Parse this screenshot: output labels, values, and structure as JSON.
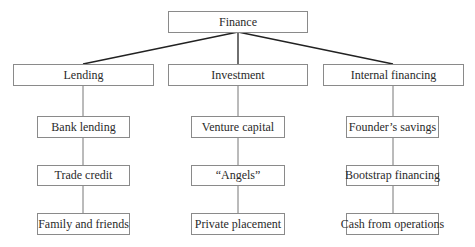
{
  "diagram": {
    "root": {
      "label": "Finance"
    },
    "categories": [
      {
        "label": "Lending",
        "children": [
          "Bank lending",
          "Trade credit",
          "Family and friends"
        ]
      },
      {
        "label": "Investment",
        "children": [
          "Venture capital",
          "“Angels”",
          "Private placement"
        ]
      },
      {
        "label": "Internal financing",
        "children": [
          "Founder’s savings",
          "Bootstrap financing",
          "Cash from operations"
        ]
      }
    ]
  }
}
